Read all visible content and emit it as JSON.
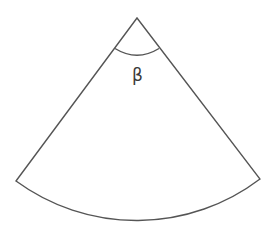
{
  "diagram": {
    "type": "circular-sector",
    "stroke_color": "#555555",
    "fill_color": "#ffffff",
    "apex": {
      "x": 137,
      "y": 18
    },
    "left_corner": {
      "x": 16,
      "y": 181
    },
    "right_corner": {
      "x": 260,
      "y": 179
    },
    "arc_bottom_y": 223,
    "angle_label": "β"
  }
}
